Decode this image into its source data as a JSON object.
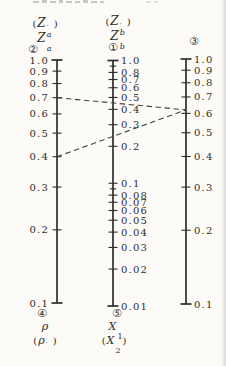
{
  "colors": {
    "paper": "#fcfbf7",
    "ink": "#2e2c28",
    "dash_line": "#45423c"
  },
  "header": {
    "left": {
      "alt": {
        "open": "(",
        "main": "Z",
        "sup": "′",
        "sub": "a",
        "close": ")"
      },
      "main": {
        "main": "Z",
        "sub": "a"
      },
      "circle": "②"
    },
    "middle": {
      "alt": {
        "open": "(",
        "main": "Z",
        "sup": "′",
        "sub": "b",
        "close": ")"
      },
      "main": {
        "main": "Z",
        "sub": "b"
      },
      "circle": "①"
    },
    "right": {
      "circle": "③"
    }
  },
  "footer": {
    "left": {
      "circle": "④",
      "main": {
        "main": "ρ",
        "sub": ""
      },
      "alt": {
        "open": "(",
        "main": "ρ",
        "sup": "′",
        "sub": "",
        "close": ")"
      }
    },
    "middle": {
      "circle": "⑤",
      "main": {
        "main": "X",
        "sub": "1"
      },
      "alt": {
        "open": "(",
        "main": "X",
        "sup": "",
        "sub": "2",
        "close": ")"
      }
    }
  },
  "chart_data": {
    "type": "nomogram",
    "grid": false,
    "scales": [
      {
        "id": "scale-2",
        "position": "left",
        "circle_top": "②",
        "circle_bottom": "④",
        "quantity_top": "Za",
        "quantity_top_alt": "Za′",
        "quantity_bottom": "ρ",
        "quantity_bottom_alt": "ρ′",
        "log": true,
        "range_top": 1.0,
        "range_bottom": 0.1,
        "label_side": "left",
        "ticks": [
          {
            "value": 1.0,
            "label": "1.0"
          },
          {
            "value": 0.9,
            "label": "0.9"
          },
          {
            "value": 0.8,
            "label": "0.8"
          },
          {
            "value": 0.7,
            "label": "0.7"
          },
          {
            "value": 0.6,
            "label": "0.6"
          },
          {
            "value": 0.5,
            "label": "0.5"
          },
          {
            "value": 0.4,
            "label": "0.4"
          },
          {
            "value": 0.3,
            "label": "0.3"
          },
          {
            "value": 0.2,
            "label": "0.2"
          },
          {
            "value": 0.1,
            "label": "0.1"
          }
        ]
      },
      {
        "id": "scale-1",
        "position": "middle",
        "circle_top": "①",
        "circle_bottom": "⑤",
        "quantity_top": "Zb",
        "quantity_top_alt": "Zb′",
        "quantity_bottom": "X1",
        "quantity_bottom_alt": "X2",
        "log": true,
        "range_top": 1.0,
        "range_bottom": 0.01,
        "label_side": "right",
        "ticks": [
          {
            "value": 1.0,
            "label": "1.0"
          },
          {
            "value": 0.9,
            "label": ""
          },
          {
            "value": 0.8,
            "label": "0.8"
          },
          {
            "value": 0.7,
            "label": "0.7"
          },
          {
            "value": 0.6,
            "label": "0.6"
          },
          {
            "value": 0.5,
            "label": "0.5"
          },
          {
            "value": 0.4,
            "label": "0.4"
          },
          {
            "value": 0.3,
            "label": "0.3"
          },
          {
            "value": 0.2,
            "label": "0.2"
          },
          {
            "value": 0.1,
            "label": "0.1"
          },
          {
            "value": 0.09,
            "label": ""
          },
          {
            "value": 0.08,
            "label": "0.08"
          },
          {
            "value": 0.07,
            "label": "0.07"
          },
          {
            "value": 0.06,
            "label": "0.06"
          },
          {
            "value": 0.05,
            "label": "0.05"
          },
          {
            "value": 0.04,
            "label": "0.04"
          },
          {
            "value": 0.03,
            "label": "0.03"
          },
          {
            "value": 0.02,
            "label": "0.02"
          },
          {
            "value": 0.01,
            "label": "0.01"
          }
        ]
      },
      {
        "id": "scale-3",
        "position": "right",
        "circle_top": "③",
        "circle_bottom": "",
        "quantity_top": "",
        "quantity_top_alt": "",
        "quantity_bottom": "",
        "quantity_bottom_alt": "",
        "log": true,
        "range_top": 1.0,
        "range_bottom": 0.1,
        "label_side": "right",
        "ticks": [
          {
            "value": 1.0,
            "label": "1.0"
          },
          {
            "value": 0.9,
            "label": "0.9"
          },
          {
            "value": 0.8,
            "label": "0.8"
          },
          {
            "value": 0.7,
            "label": "0.7"
          },
          {
            "value": 0.6,
            "label": "0.6"
          },
          {
            "value": 0.5,
            "label": "0.5"
          },
          {
            "value": 0.4,
            "label": "0.4"
          },
          {
            "value": 0.3,
            "label": "0.3"
          },
          {
            "value": 0.2,
            "label": "0.2"
          },
          {
            "value": 0.1,
            "label": "0.1"
          }
        ]
      }
    ],
    "example_lines": [
      {
        "from": {
          "scale": 0,
          "value": 0.7
        },
        "to": {
          "scale": 2,
          "value": 0.62
        }
      },
      {
        "from": {
          "scale": 0,
          "value": 0.4
        },
        "to": {
          "scale": 2,
          "value": 0.62
        }
      }
    ]
  }
}
